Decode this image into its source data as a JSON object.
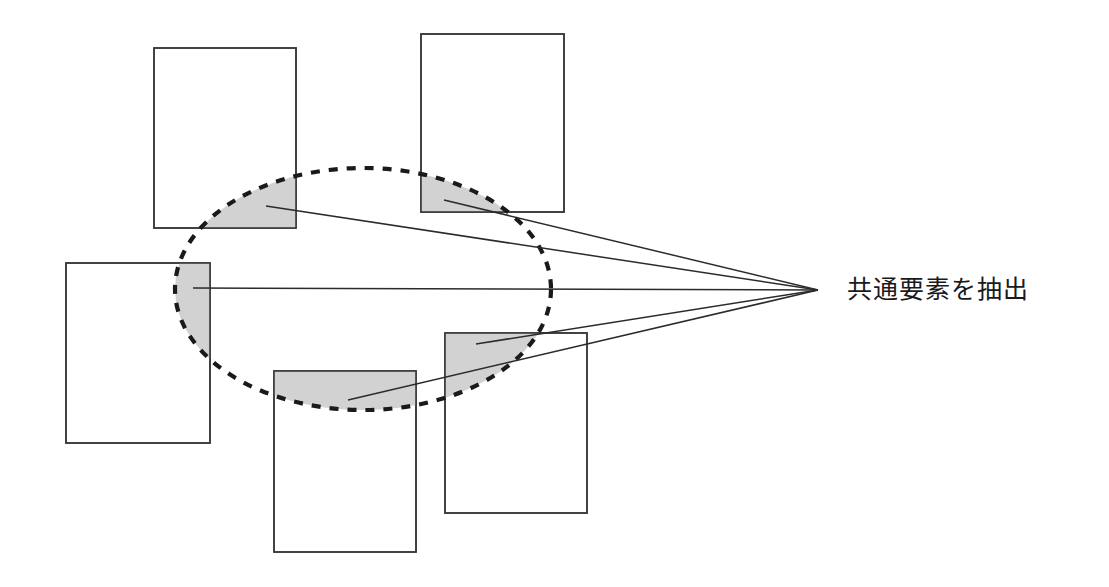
{
  "diagram": {
    "title_text": "共通要素を抽出",
    "caption": {
      "label": "共通要素を抽出",
      "x": 847,
      "y": 277,
      "font_size": 25
    },
    "colors": {
      "background": "#ffffff",
      "rectangle_stroke": "#3b3b3b",
      "rectangle_fill": "#ffffff",
      "shaded_fill": "#d2d2d2",
      "ellipse_stroke": "#1a1a1a",
      "line_stroke": "#2b2b2b",
      "text": "#1a1a1a"
    },
    "ellipse": {
      "name": "common-element-cluster-ellipse",
      "cx": 363,
      "cy": 289,
      "rx": 188,
      "ry": 121,
      "stroke_dasharray": "9 9",
      "stroke_width": 4.2
    },
    "convergence_point": {
      "x": 818,
      "y": 290
    },
    "rectangles": [
      {
        "name": "document-rect-top-left",
        "x": 154,
        "y": 48,
        "width": 142,
        "height": 180
      },
      {
        "name": "document-rect-top-right",
        "x": 421,
        "y": 34,
        "width": 143,
        "height": 178
      },
      {
        "name": "document-rect-middle-left",
        "x": 66,
        "y": 263,
        "width": 144,
        "height": 180
      },
      {
        "name": "document-rect-bottom-center",
        "x": 274,
        "y": 371,
        "width": 142,
        "height": 181
      },
      {
        "name": "document-rect-bottom-right",
        "x": 445,
        "y": 333,
        "width": 142,
        "height": 180
      }
    ],
    "pointer_lines": [
      {
        "name": "pointer-line-top-left",
        "x1": 266,
        "y1": 206,
        "x2": 818,
        "y2": 290
      },
      {
        "name": "pointer-line-top-right",
        "x1": 444,
        "y1": 200,
        "x2": 818,
        "y2": 290
      },
      {
        "name": "pointer-line-middle-left",
        "x1": 193,
        "y1": 288,
        "x2": 818,
        "y2": 290
      },
      {
        "name": "pointer-line-bottom-center",
        "x1": 348,
        "y1": 400,
        "x2": 818,
        "y2": 290
      },
      {
        "name": "pointer-line-bottom-right",
        "x1": 476,
        "y1": 344,
        "x2": 818,
        "y2": 290
      }
    ],
    "shaded_regions": [
      {
        "name": "shaded-region-top-left",
        "description": "intersection of top-left document and cluster ellipse"
      },
      {
        "name": "shaded-region-top-right",
        "description": "intersection of top-right document and cluster ellipse"
      },
      {
        "name": "shaded-region-middle-left",
        "description": "intersection of middle-left document and cluster ellipse"
      },
      {
        "name": "shaded-region-bottom-center",
        "description": "intersection of bottom-center document and cluster ellipse"
      },
      {
        "name": "shaded-region-bottom-right",
        "description": "intersection of bottom-right document and cluster ellipse"
      }
    ]
  }
}
